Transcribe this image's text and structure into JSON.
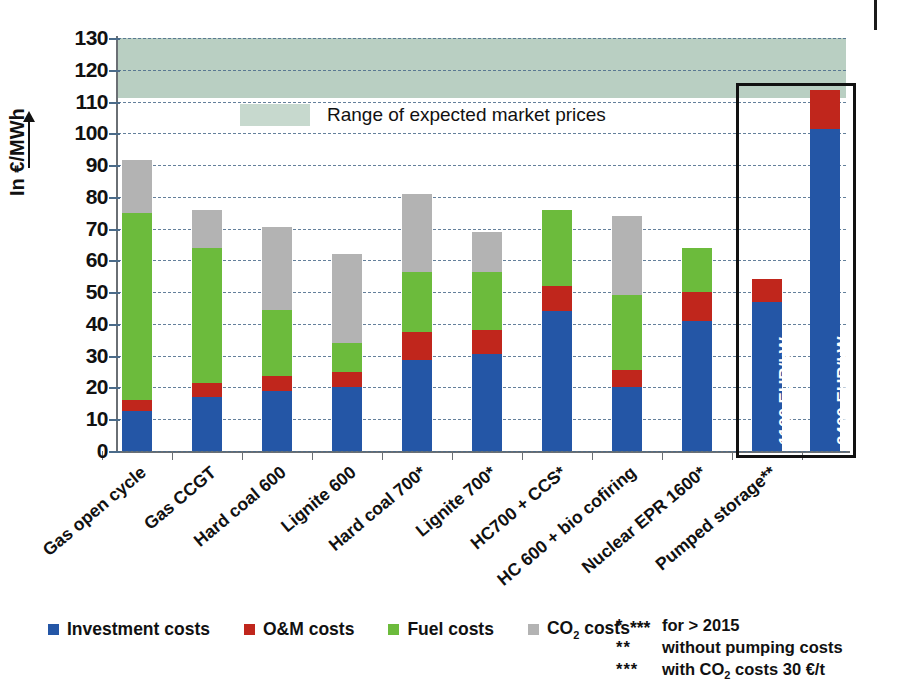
{
  "chart_data": {
    "type": "bar",
    "stacked": true,
    "title": "",
    "xlabel": "",
    "ylabel": "In €/MWh",
    "ylim": [
      0,
      130
    ],
    "ytick_step": 10,
    "yticks": [
      0,
      10,
      20,
      30,
      40,
      50,
      60,
      70,
      80,
      90,
      100,
      110,
      120,
      130
    ],
    "grid": "horizontal-dashed",
    "legend_position": "bottom-left",
    "categories": [
      "Gas open cycle",
      "Gas CCGT",
      "Hard coal 600",
      "Lignite 600",
      "Hard coal 700*",
      "Lignite 700*",
      "HC700 + CCS*",
      "HC 600 + bio cofiring",
      "Nuclear EPR 1600*",
      "Pumped storage**"
    ],
    "series": [
      {
        "name": "Investment costs",
        "color": "#2456a6",
        "values": [
          12.5,
          17,
          19,
          20,
          28.5,
          30.5,
          44,
          20,
          41,
          47
        ]
      },
      {
        "name": "O&M costs",
        "color": "#c0261c",
        "values": [
          3.5,
          4.5,
          4.5,
          5,
          9,
          7.5,
          8,
          5.5,
          9,
          0
        ]
      },
      {
        "name": "Fuel costs",
        "color": "#6cbb3c",
        "values": [
          59,
          42.5,
          21,
          9,
          19,
          18.5,
          24,
          23.5,
          14,
          0
        ]
      },
      {
        "name": "CO2 costs***",
        "color": "#b3b3b3",
        "values": [
          16.5,
          12,
          26,
          28,
          24.5,
          12.5,
          0,
          25,
          0,
          0
        ]
      }
    ],
    "totals": [
      91.5,
      76,
      70.5,
      62,
      80.5,
      69,
      76,
      74,
      64,
      54
    ],
    "extra_bars": [
      {
        "group": "Pumped storage**",
        "label": "1100 EUR/kW",
        "total": 54,
        "segments": [
          {
            "name": "Investment costs",
            "value": 47
          },
          {
            "name": "O&M costs",
            "value": 7
          }
        ]
      },
      {
        "group": "Pumped storage**",
        "label": "2400 EUR/kW",
        "total": 113.5,
        "segments": [
          {
            "name": "Investment costs",
            "value": 101.5
          },
          {
            "name": "O&M costs",
            "value": 12
          }
        ]
      }
    ],
    "band": {
      "label": "Range of expected market prices",
      "from": 41,
      "to": 60,
      "color": "#b9cfc2"
    },
    "highlight_box": {
      "around": "Pumped storage**",
      "color": "#111111"
    }
  },
  "axis": {
    "y_title": "In €/MWh",
    "y_labels": [
      "130",
      "120",
      "110",
      "100",
      "90",
      "80",
      "70",
      "60",
      "50",
      "40",
      "30",
      "20",
      "10",
      "0"
    ]
  },
  "annotation": {
    "band_label": "Range of expected market prices"
  },
  "bar_labels": {
    "pumped_1100": "1100 EUR/kW",
    "pumped_2400": "2400 EUR/kW"
  },
  "categories": [
    "Gas open cycle",
    "Gas CCGT",
    "Hard coal 600",
    "Lignite 600",
    "Hard coal 700*",
    "Lignite 700*",
    "HC700 + CCS*",
    "HC 600 + bio cofiring",
    "Nuclear EPR 1600*",
    "Pumped storage**"
  ],
  "legend": {
    "items": [
      {
        "label": "Investment costs",
        "color": "#2456a6"
      },
      {
        "label": "O&M costs",
        "color": "#c0261c"
      },
      {
        "label": "Fuel costs",
        "color": "#6cbb3c"
      },
      {
        "label": "CO2 costs***",
        "color": "#b3b3b3",
        "html": "CO<sub>2</sub> costs***"
      }
    ]
  },
  "footnotes": [
    {
      "mark": "*",
      "text": "for > 2015"
    },
    {
      "mark": "**",
      "text": "without pumping costs"
    },
    {
      "mark": "***",
      "text": "with CO2 costs 30 €/t",
      "html": "with CO<sub>2</sub> costs 30 €/t"
    }
  ]
}
